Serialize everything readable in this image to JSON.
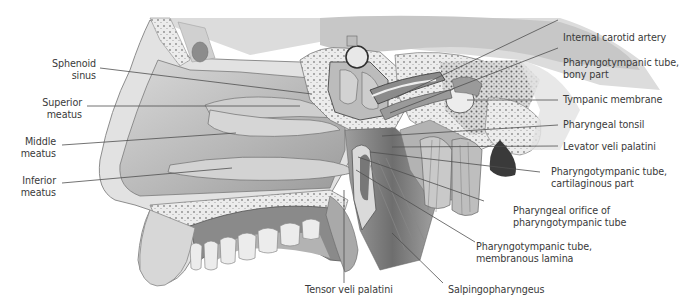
{
  "figure": {
    "type": "anatomical-illustration",
    "view": "midsagittal section of nasal cavity and nasopharynx",
    "palette": {
      "background": "#ffffff",
      "label_text": "#3a3a3a",
      "leader_line": "#555555",
      "bone": "#e6e6e6",
      "soft_tissue": "#bdbdbd",
      "mucosa": "#a9a9a9",
      "shadow": "#6f6f6f"
    }
  },
  "labels_left": [
    {
      "id": "sphenoid-sinus",
      "line1": "Sphenoid",
      "line2": "sinus"
    },
    {
      "id": "superior-meatus",
      "line1": "Superior",
      "line2": "meatus"
    },
    {
      "id": "middle-meatus",
      "line1": "Middle",
      "line2": "meatus"
    },
    {
      "id": "inferior-meatus",
      "line1": "Inferior",
      "line2": "meatus"
    }
  ],
  "labels_right": [
    {
      "id": "internal-carotid-artery",
      "line1": "Internal carotid artery",
      "line2": ""
    },
    {
      "id": "pharyngotympanic-tube-bony",
      "line1": "Pharyngotympanic tube,",
      "line2": "bony part"
    },
    {
      "id": "tympanic-membrane",
      "line1": "Tympanic membrane",
      "line2": ""
    },
    {
      "id": "pharyngeal-tonsil",
      "line1": "Pharyngeal tonsil",
      "line2": ""
    },
    {
      "id": "levator-veli-palatini",
      "line1": "Levator veli palatini",
      "line2": ""
    },
    {
      "id": "pharyngotympanic-tube-cartilaginous",
      "line1": "Pharyngotympanic tube,",
      "line2": "cartilaginous part"
    },
    {
      "id": "pharyngeal-orifice",
      "line1": "Pharyngeal orifice of",
      "line2": "pharyngotympanic tube"
    },
    {
      "id": "pharyngotympanic-tube-membranous",
      "line1": "Pharyngotympanic tube,",
      "line2": "membranous lamina"
    }
  ],
  "labels_bottom": [
    {
      "id": "tensor-veli-palatini",
      "line1": "Tensor veli palatini"
    },
    {
      "id": "salpingopharyngeus",
      "line1": "Salpingopharyngeus"
    }
  ]
}
